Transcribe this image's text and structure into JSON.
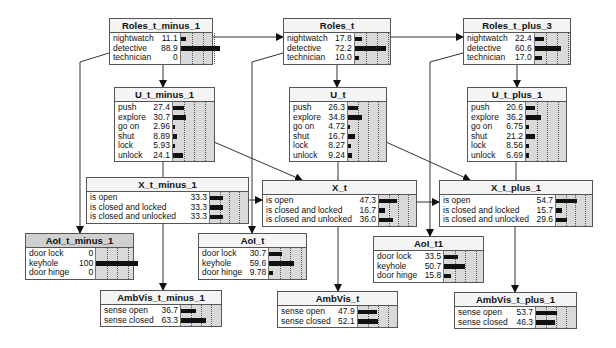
{
  "diagram": {
    "type": "dynamic-bayesian-network",
    "nodes": [
      {
        "id": "roles_t_minus_1",
        "title": "Roles_t_minus_1",
        "x": 109,
        "y": 18,
        "w": 104,
        "namew": 52,
        "barw": 44,
        "states": [
          {
            "name": "nightwatch",
            "value": "11.1",
            "p": 11.1
          },
          {
            "name": "detective",
            "value": "88.9",
            "p": 88.9
          },
          {
            "name": "technician",
            "value": "0",
            "p": 0
          }
        ]
      },
      {
        "id": "u_t_minus_1",
        "title": "U_t_minus_1",
        "x": 114,
        "y": 87,
        "w": 101,
        "namew": 30,
        "barw": 42,
        "states": [
          {
            "name": "push",
            "value": "27.4",
            "p": 27.4
          },
          {
            "name": "explore",
            "value": "30.7",
            "p": 30.7
          },
          {
            "name": "go on",
            "value": "2.96",
            "p": 2.96
          },
          {
            "name": "shut",
            "value": "8.89",
            "p": 8.89
          },
          {
            "name": "lock",
            "value": "5.93",
            "p": 5.93
          },
          {
            "name": "unlock",
            "value": "24.1",
            "p": 24.1
          }
        ]
      },
      {
        "id": "x_t_minus_1",
        "title": "X_t_minus_1",
        "x": 86,
        "y": 177,
        "w": 163,
        "namew": 92,
        "barw": 38,
        "states": [
          {
            "name": "is open",
            "value": "33.3",
            "p": 33.3
          },
          {
            "name": "is closed and locked",
            "value": "33.3",
            "p": 33.3
          },
          {
            "name": "is closed and unlocked",
            "value": "33.3",
            "p": 33.3
          }
        ]
      },
      {
        "id": "aoi_t_minus_1",
        "title": "AoI_t_minus_1",
        "x": 25,
        "y": 233,
        "w": 109,
        "namew": 38,
        "barw": 42,
        "evidence": true,
        "states": [
          {
            "name": "door lock",
            "value": "0",
            "p": 0
          },
          {
            "name": "keyhole",
            "value": "100",
            "p": 100
          },
          {
            "name": "door hinge",
            "value": "0",
            "p": 0
          }
        ]
      },
      {
        "id": "ambvis_t_minus_1",
        "title": "AmbVis_t_minus_1",
        "x": 100,
        "y": 290,
        "w": 122,
        "namew": 50,
        "barw": 40,
        "states": [
          {
            "name": "sense open",
            "value": "36.7",
            "p": 36.7
          },
          {
            "name": "sense closed",
            "value": "63.3",
            "p": 63.3
          }
        ]
      },
      {
        "id": "roles_t",
        "title": "Roles_t",
        "x": 283,
        "y": 18,
        "w": 108,
        "namew": 52,
        "barw": 44,
        "states": [
          {
            "name": "nightwatch",
            "value": "17.8",
            "p": 17.8
          },
          {
            "name": "detective",
            "value": "72.2",
            "p": 72.2
          },
          {
            "name": "technician",
            "value": "10.0",
            "p": 10.0
          }
        ]
      },
      {
        "id": "u_t",
        "title": "U_t",
        "x": 289,
        "y": 87,
        "w": 98,
        "namew": 30,
        "barw": 40,
        "states": [
          {
            "name": "push",
            "value": "26.3",
            "p": 26.3
          },
          {
            "name": "explore",
            "value": "34.8",
            "p": 34.8
          },
          {
            "name": "go on",
            "value": "4.72",
            "p": 4.72
          },
          {
            "name": "shut",
            "value": "16.7",
            "p": 16.7
          },
          {
            "name": "lock",
            "value": "8.27",
            "p": 8.27
          },
          {
            "name": "unlock",
            "value": "9.24",
            "p": 9.24
          }
        ]
      },
      {
        "id": "x_t",
        "title": "X_t",
        "x": 262,
        "y": 180,
        "w": 155,
        "namew": 88,
        "barw": 38,
        "states": [
          {
            "name": "is open",
            "value": "47.3",
            "p": 47.3
          },
          {
            "name": "is closed and locked",
            "value": "16.7",
            "p": 16.7
          },
          {
            "name": "is closed and unlocked",
            "value": "36.0",
            "p": 36.0
          }
        ]
      },
      {
        "id": "aoi_t",
        "title": "AoI_t",
        "x": 198,
        "y": 233,
        "w": 109,
        "namew": 38,
        "barw": 42,
        "states": [
          {
            "name": "door lock",
            "value": "30.7",
            "p": 30.7
          },
          {
            "name": "keyhole",
            "value": "59.6",
            "p": 59.6
          },
          {
            "name": "door hinge",
            "value": "9.78",
            "p": 9.78
          }
        ]
      },
      {
        "id": "ambvis_t",
        "title": "AmbVis_t",
        "x": 277,
        "y": 291,
        "w": 121,
        "namew": 50,
        "barw": 40,
        "states": [
          {
            "name": "sense open",
            "value": "47.9",
            "p": 47.9
          },
          {
            "name": "sense closed",
            "value": "52.1",
            "p": 52.1
          }
        ]
      },
      {
        "id": "roles_t_plus_3",
        "title": "Roles_t_plus_3",
        "x": 463,
        "y": 18,
        "w": 108,
        "namew": 52,
        "barw": 44,
        "states": [
          {
            "name": "nightwatch",
            "value": "22.4",
            "p": 22.4
          },
          {
            "name": "detective",
            "value": "60.6",
            "p": 60.6
          },
          {
            "name": "technician",
            "value": "17.0",
            "p": 17.0
          }
        ]
      },
      {
        "id": "u_t_plus_1",
        "title": "U_t_plus_1",
        "x": 467,
        "y": 87,
        "w": 100,
        "namew": 30,
        "barw": 42,
        "states": [
          {
            "name": "push",
            "value": "20.6",
            "p": 20.6
          },
          {
            "name": "explore",
            "value": "36.2",
            "p": 36.2
          },
          {
            "name": "go on",
            "value": "6.75",
            "p": 6.75
          },
          {
            "name": "shut",
            "value": "21.2",
            "p": 21.2
          },
          {
            "name": "lock",
            "value": "8.56",
            "p": 8.56
          },
          {
            "name": "unlock",
            "value": "6.69",
            "p": 6.69
          }
        ]
      },
      {
        "id": "x_t_plus_1",
        "title": "X_t_plus_1",
        "x": 439,
        "y": 180,
        "w": 154,
        "namew": 88,
        "barw": 38,
        "states": [
          {
            "name": "is open",
            "value": "54.7",
            "p": 54.7
          },
          {
            "name": "is closed and locked",
            "value": "15.7",
            "p": 15.7
          },
          {
            "name": "is closed and unlocked",
            "value": "29.6",
            "p": 29.6
          }
        ]
      },
      {
        "id": "aoi_t1",
        "title": "AoI_t1",
        "x": 373,
        "y": 236,
        "w": 111,
        "namew": 38,
        "barw": 42,
        "states": [
          {
            "name": "door lock",
            "value": "33.5",
            "p": 33.5
          },
          {
            "name": "keyhole",
            "value": "50.7",
            "p": 50.7
          },
          {
            "name": "door hinge",
            "value": "15.8",
            "p": 15.8
          }
        ]
      },
      {
        "id": "ambvis_t_plus_1",
        "title": "AmbVis_t_plus_1",
        "x": 454,
        "y": 292,
        "w": 123,
        "namew": 50,
        "barw": 40,
        "states": [
          {
            "name": "sense open",
            "value": "53.7",
            "p": 53.7
          },
          {
            "name": "sense closed",
            "value": "46.3",
            "p": 46.3
          }
        ]
      }
    ],
    "edges": [
      {
        "from": "roles_t_minus_1",
        "to": "roles_t",
        "points": [
          [
            212,
            37
          ],
          [
            283,
            37
          ]
        ]
      },
      {
        "from": "roles_t",
        "to": "roles_t_plus_3",
        "points": [
          [
            390,
            37
          ],
          [
            463,
            37
          ]
        ]
      },
      {
        "from": "roles_t_minus_1",
        "to": "u_t_minus_1",
        "points": [
          [
            163,
            57
          ],
          [
            163,
            87
          ]
        ]
      },
      {
        "from": "roles_t",
        "to": "u_t",
        "points": [
          [
            337,
            57
          ],
          [
            337,
            87
          ]
        ]
      },
      {
        "from": "roles_t_plus_3",
        "to": "u_t_plus_1",
        "points": [
          [
            517,
            57
          ],
          [
            517,
            87
          ]
        ]
      },
      {
        "from": "x_t_minus_1",
        "to": "u_t_minus_1",
        "points": [
          [
            163,
            177
          ],
          [
            163,
            153
          ]
        ]
      },
      {
        "from": "x_t",
        "to": "u_t",
        "points": [
          [
            338,
            180
          ],
          [
            338,
            153
          ]
        ]
      },
      {
        "from": "x_t_plus_1",
        "to": "u_t_plus_1",
        "points": [
          [
            516,
            180
          ],
          [
            516,
            153
          ]
        ]
      },
      {
        "from": "u_t_minus_1",
        "to": "x_t",
        "points": [
          [
            214,
            142
          ],
          [
            302,
            180
          ]
        ]
      },
      {
        "from": "u_t",
        "to": "x_t_plus_1",
        "points": [
          [
            386,
            142
          ],
          [
            470,
            180
          ]
        ]
      },
      {
        "from": "x_t_minus_1",
        "to": "x_t",
        "points": [
          [
            248,
            200
          ],
          [
            262,
            200
          ]
        ]
      },
      {
        "from": "x_t",
        "to": "x_t_plus_1",
        "points": [
          [
            416,
            202
          ],
          [
            439,
            202
          ]
        ]
      },
      {
        "from": "roles_t_minus_1",
        "to": "aoi_t_minus_1",
        "points": [
          [
            109,
            53
          ],
          [
            80,
            62
          ],
          [
            80,
            233
          ]
        ]
      },
      {
        "from": "roles_t",
        "to": "aoi_t",
        "points": [
          [
            283,
            53
          ],
          [
            252,
            62
          ],
          [
            252,
            233
          ]
        ]
      },
      {
        "from": "roles_t_plus_3",
        "to": "aoi_t1",
        "points": [
          [
            463,
            53
          ],
          [
            430,
            62
          ],
          [
            430,
            236
          ]
        ]
      },
      {
        "from": "x_t_minus_1",
        "to": "ambvis_t_minus_1",
        "points": [
          [
            163,
            221
          ],
          [
            163,
            290
          ]
        ]
      },
      {
        "from": "x_t",
        "to": "ambvis_t",
        "points": [
          [
            338,
            224
          ],
          [
            338,
            291
          ]
        ]
      },
      {
        "from": "x_t_plus_1",
        "to": "ambvis_t_plus_1",
        "points": [
          [
            515,
            224
          ],
          [
            515,
            292
          ]
        ]
      }
    ]
  }
}
